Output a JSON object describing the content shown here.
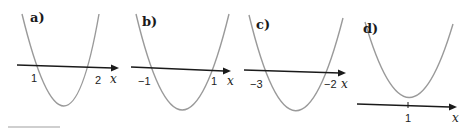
{
  "figure": {
    "panels": [
      {
        "label": "a)",
        "roots": [
          1,
          2
        ],
        "root_labels": [
          "1",
          "2"
        ],
        "axis_var": "x",
        "shape": "upward parabola crossing x-axis at 1 and 2"
      },
      {
        "label": "b)",
        "roots": [
          -1,
          1
        ],
        "root_labels": [
          "−1",
          "1"
        ],
        "axis_var": "x",
        "shape": "upward parabola crossing x-axis at -1 and 1"
      },
      {
        "label": "c)",
        "roots": [
          -3,
          -2
        ],
        "root_labels": [
          "−3",
          "−2"
        ],
        "axis_var": "x",
        "shape": "upward parabola crossing x-axis at -3 and -2"
      },
      {
        "label": "d)",
        "roots": [
          1
        ],
        "root_labels": [
          "1"
        ],
        "axis_var": "x",
        "shape": "upward parabola touching x-axis at 1"
      }
    ],
    "colors": {
      "curve": "#9a9a9a",
      "axis": "#1a1a1a",
      "background": "#ffffff"
    }
  }
}
